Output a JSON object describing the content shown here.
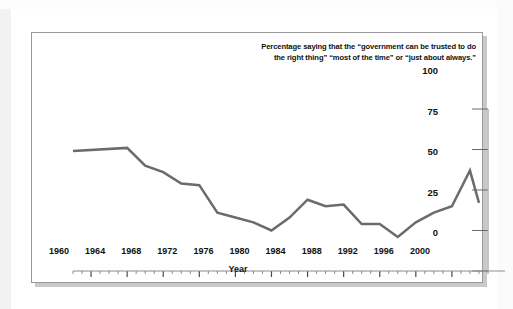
{
  "figure": {
    "title_line1": "Percentage saying that the “government can be trusted to do",
    "title_line2": "the right thing” “most of the time” or “just about always.”",
    "frame_color": "#9a9a9a",
    "background": "#ffffff"
  },
  "chart_data": {
    "type": "line",
    "title": "Percentage saying that the “government can be trusted to do the right thing” “most of the time” or “just about always.”",
    "xlabel": "Year",
    "ylabel": "",
    "xlim": [
      1958,
      2004
    ],
    "ylim": [
      0,
      100
    ],
    "grid": false,
    "legend": null,
    "y_axis_position": "right",
    "yticks": [
      0,
      25,
      50,
      75,
      100
    ],
    "ytick_labels": [
      "0",
      "25",
      "50",
      "75",
      "100"
    ],
    "xticks": [
      1960,
      1964,
      1968,
      1972,
      1976,
      1980,
      1984,
      1988,
      1992,
      1996,
      2000
    ],
    "xtick_labels": [
      "1960",
      "1964",
      "1968",
      "1972",
      "1976",
      "1980",
      "1984",
      "1988",
      "1992",
      "1996",
      "2000"
    ],
    "minor_xtick_interval": 1,
    "line_color": "#6b6b6b",
    "line_width": 2.5,
    "series": [
      {
        "name": "Trust in government",
        "x": [
          1958,
          1964,
          1966,
          1968,
          1970,
          1972,
          1974,
          1976,
          1978,
          1980,
          1982,
          1984,
          1986,
          1988,
          1990,
          1992,
          1994,
          1996,
          1998,
          2000,
          2002,
          2003
        ],
        "values": [
          74,
          76,
          65,
          61,
          54,
          53,
          36,
          33,
          30,
          25,
          33,
          44,
          40,
          41,
          29,
          29,
          21,
          30,
          36,
          40,
          62,
          42
        ]
      }
    ]
  }
}
